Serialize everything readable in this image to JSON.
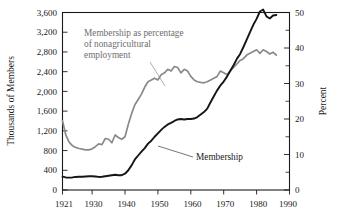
{
  "chart_data": {
    "type": "line",
    "title": "",
    "xlabel": "",
    "ylabel": "Thousands of Members",
    "y2label": "Percent",
    "xlim": [
      1921,
      1990
    ],
    "ylim": [
      0,
      3600
    ],
    "y2lim": [
      0,
      50
    ],
    "grid": false,
    "legend_position": "inline-annotations",
    "x_ticks": [
      "1921",
      "1930",
      "1940",
      "1950",
      "1960",
      "1970",
      "1980",
      "1990"
    ],
    "x_tick_values": [
      1921,
      1930,
      1940,
      1950,
      1960,
      1970,
      1980,
      1990
    ],
    "y_ticks": [
      "0",
      "400",
      "800",
      "1,200",
      "1,600",
      "2,000",
      "2,400",
      "2,800",
      "3,200",
      "3,600"
    ],
    "y_tick_values": [
      0,
      400,
      800,
      1200,
      1600,
      2000,
      2400,
      2800,
      3200,
      3600
    ],
    "y2_ticks": [
      "0",
      "10",
      "20",
      "30",
      "40",
      "50"
    ],
    "y2_tick_values": [
      0,
      10,
      20,
      30,
      40,
      50
    ],
    "y2_minor_tick_values": [
      5,
      15,
      25,
      35,
      45
    ],
    "annotations": [
      {
        "name": "percent-series-annotation",
        "lines": [
          "Membership as percentage",
          "of nonagricultural",
          "employment"
        ],
        "color": "#6e6e6e"
      },
      {
        "name": "membership-series-annotation",
        "lines": [
          "Membership"
        ],
        "color": "#1a1a1a"
      }
    ],
    "series": [
      {
        "name": "Membership",
        "axis": "left",
        "units": "thousands of members",
        "color": "#151515",
        "x": [
          1921,
          1922,
          1923,
          1924,
          1925,
          1926,
          1927,
          1928,
          1929,
          1930,
          1931,
          1932,
          1933,
          1934,
          1935,
          1936,
          1937,
          1938,
          1939,
          1940,
          1941,
          1942,
          1943,
          1944,
          1945,
          1946,
          1947,
          1948,
          1949,
          1950,
          1951,
          1952,
          1953,
          1954,
          1955,
          1956,
          1957,
          1958,
          1959,
          1960,
          1961,
          1962,
          1963,
          1964,
          1965,
          1966,
          1967,
          1968,
          1969,
          1970,
          1971,
          1972,
          1973,
          1974,
          1975,
          1976,
          1977,
          1978,
          1979,
          1980,
          1981,
          1982,
          1983,
          1984,
          1985,
          1986
        ],
        "values": [
          270,
          255,
          250,
          255,
          265,
          270,
          270,
          275,
          280,
          280,
          275,
          265,
          270,
          280,
          290,
          300,
          310,
          300,
          300,
          330,
          400,
          500,
          620,
          700,
          780,
          850,
          940,
          1000,
          1080,
          1150,
          1220,
          1280,
          1330,
          1360,
          1400,
          1430,
          1440,
          1430,
          1440,
          1440,
          1450,
          1480,
          1530,
          1580,
          1650,
          1780,
          1900,
          2020,
          2120,
          2200,
          2300,
          2420,
          2530,
          2660,
          2760,
          2900,
          3050,
          3200,
          3350,
          3470,
          3620,
          3660,
          3520,
          3480,
          3540,
          3550
        ]
      },
      {
        "name": "Membership as percentage of nonagricultural employment",
        "axis": "right",
        "units": "percent",
        "color": "#8a8a8a",
        "x": [
          1921,
          1922,
          1923,
          1924,
          1925,
          1926,
          1927,
          1928,
          1929,
          1930,
          1931,
          1932,
          1933,
          1934,
          1935,
          1936,
          1937,
          1938,
          1939,
          1940,
          1941,
          1942,
          1943,
          1944,
          1945,
          1946,
          1947,
          1948,
          1949,
          1950,
          1951,
          1952,
          1953,
          1954,
          1955,
          1956,
          1957,
          1958,
          1959,
          1960,
          1961,
          1962,
          1963,
          1964,
          1965,
          1966,
          1967,
          1968,
          1969,
          1970,
          1971,
          1972,
          1973,
          1974,
          1975,
          1976,
          1977,
          1978,
          1979,
          1980,
          1981,
          1982,
          1983,
          1984,
          1985,
          1986
        ],
        "values": [
          19.5,
          15.5,
          13.5,
          12.5,
          12.0,
          11.7,
          11.5,
          11.3,
          11.3,
          11.6,
          12.2,
          13.0,
          12.8,
          14.5,
          14.3,
          13.3,
          15.5,
          14.8,
          14.3,
          15.0,
          18.5,
          21.5,
          24.0,
          25.5,
          27.0,
          29.0,
          30.5,
          31.0,
          31.5,
          31.0,
          32.5,
          33.0,
          34.0,
          33.5,
          34.8,
          34.5,
          33.0,
          34.0,
          33.5,
          32.0,
          31.0,
          30.5,
          30.3,
          30.2,
          30.5,
          31.0,
          31.5,
          32.0,
          33.5,
          33.0,
          32.5,
          33.5,
          34.5,
          35.5,
          36.5,
          37.0,
          38.0,
          38.5,
          39.0,
          39.5,
          38.5,
          39.5,
          39.0,
          38.3,
          38.8,
          38.0
        ]
      }
    ]
  },
  "figure": {
    "left_axis_title": "Thousands of Members",
    "right_axis_title": "Percent",
    "annotation_percent_line1": "Membership as percentage",
    "annotation_percent_line2": "of nonagricultural",
    "annotation_percent_line3": "employment",
    "annotation_membership": "Membership",
    "x_label_1921": "1921",
    "x_label_1930": "1930",
    "x_label_1940": "1940",
    "x_label_1950": "1950",
    "x_label_1960": "1960",
    "x_label_1970": "1970",
    "x_label_1980": "1980",
    "x_label_1990": "1990",
    "y_label_0": "0",
    "y_label_400": "400",
    "y_label_800": "800",
    "y_label_1200": "1,200",
    "y_label_1600": "1,600",
    "y_label_2000": "2,000",
    "y_label_2400": "2,400",
    "y_label_2800": "2,800",
    "y_label_3200": "3,200",
    "y_label_3600": "3,600",
    "y2_label_0": "0",
    "y2_label_10": "10",
    "y2_label_20": "20",
    "y2_label_30": "30",
    "y2_label_40": "40",
    "y2_label_50": "50"
  }
}
